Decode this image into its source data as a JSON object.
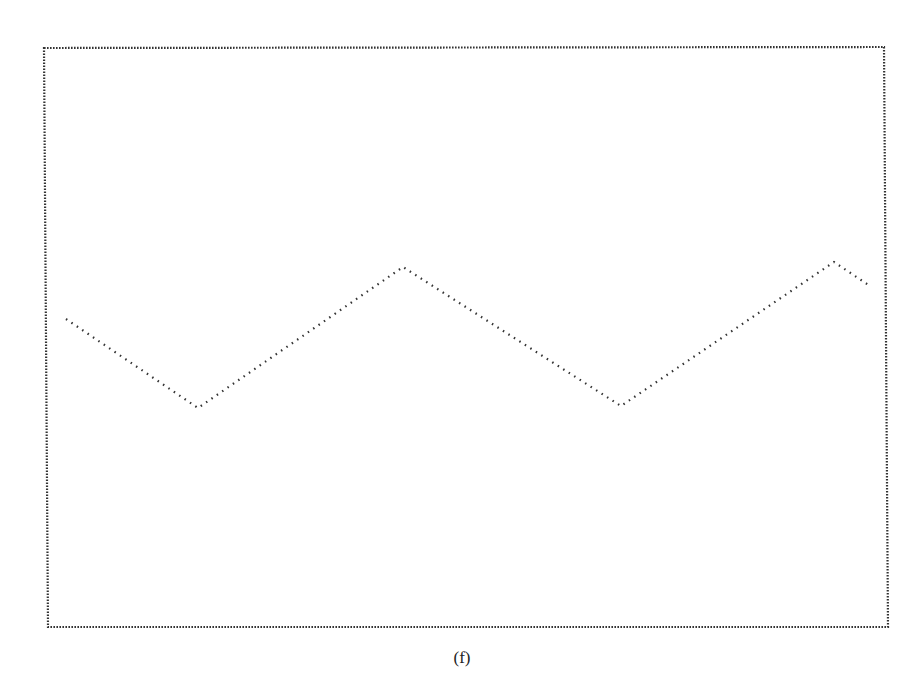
{
  "figure": {
    "caption": "(f)"
  },
  "colors": {
    "background": "#ffffff",
    "ink": "#333333"
  },
  "chart_data": {
    "type": "line",
    "title": "",
    "xlabel": "",
    "ylabel": "",
    "grid": false,
    "legend": null,
    "style": "dotted triangular waveform inside dotted rectangular frame, no axis ticks or labels",
    "frame_px": {
      "top_left": [
        44,
        48
      ],
      "top_right": [
        884,
        47
      ],
      "bottom_left": [
        48,
        627
      ],
      "bottom_right": [
        888,
        627
      ]
    },
    "series": [
      {
        "name": "triangle-wave",
        "points_px": [
          [
            66,
            319
          ],
          [
            198,
            408
          ],
          [
            403,
            267
          ],
          [
            621,
            406
          ],
          [
            834,
            262
          ],
          [
            870,
            286
          ]
        ]
      }
    ]
  }
}
